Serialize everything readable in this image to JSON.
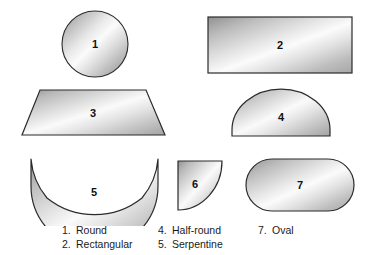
{
  "figure": {
    "background_color": "#ffffff",
    "outline_color": "#2b2b2b",
    "gradient": {
      "dark": "#8f8f8f",
      "mid_dark": "#b4b4b4",
      "highlight": "#fafafa",
      "mid_light": "#d8d8d8",
      "shadow": "#a0a0a0"
    }
  },
  "shapes": [
    {
      "number": "1",
      "name": "round",
      "kind": "circle"
    },
    {
      "number": "2",
      "name": "rectangular",
      "kind": "rectangle"
    },
    {
      "number": "3",
      "name": "trapezoid",
      "kind": "trapezoid"
    },
    {
      "number": "4",
      "name": "half-round",
      "kind": "semicircle"
    },
    {
      "number": "5",
      "name": "serpentine",
      "kind": "arc-band"
    },
    {
      "number": "6",
      "name": "quarter",
      "kind": "quarter-circle"
    },
    {
      "number": "7",
      "name": "oval",
      "kind": "stadium"
    }
  ],
  "legend": {
    "columns": [
      {
        "entries": [
          {
            "number": "1.",
            "label": "Round"
          },
          {
            "number": "2.",
            "label": "Rectangular"
          }
        ]
      },
      {
        "entries": [
          {
            "number": "4.",
            "label": "Half-round"
          },
          {
            "number": "5.",
            "label": "Serpentine"
          }
        ]
      },
      {
        "entries": [
          {
            "number": "7.",
            "label": "Oval"
          }
        ]
      }
    ]
  }
}
